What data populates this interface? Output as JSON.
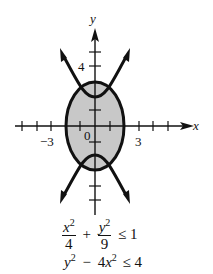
{
  "figure": {
    "axis_labels": {
      "x": "x",
      "y": "y"
    },
    "tick_labels": {
      "y_4": "4",
      "x_neg3": "−3",
      "x_3": "3",
      "origin": "0"
    },
    "regions": {
      "ellipse_fill": "#c8c8c8",
      "stroke": "#111111"
    }
  },
  "inequalities": {
    "first": {
      "term1_num_var": "x",
      "term1_num_exp": "2",
      "term1_den": "4",
      "plus": "+",
      "term2_num_var": "y",
      "term2_num_exp": "2",
      "term2_den": "9",
      "relation": "≤ 1"
    },
    "second": {
      "y_var": "y",
      "y_exp": "2",
      "minus": "−",
      "coef": "4",
      "x_var": "x",
      "x_exp": "2",
      "relation": "≤ 4"
    }
  }
}
